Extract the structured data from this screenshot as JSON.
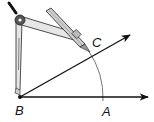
{
  "diagram": {
    "points": {
      "B": {
        "label": "B",
        "x": 20,
        "y": 97
      },
      "A": {
        "label": "A",
        "x": 103,
        "y": 97
      },
      "C": {
        "label": "C",
        "x": 93,
        "y": 57
      }
    },
    "rays": [
      {
        "from": "B",
        "to": [
          148,
          97
        ],
        "name": "ray-BA"
      },
      {
        "from": "B",
        "to": [
          130,
          35
        ],
        "name": "ray-BC"
      }
    ],
    "arc": {
      "center": "B",
      "radius": 83
    },
    "labels": {
      "B": "B",
      "A": "A",
      "C": "C"
    },
    "colors": {
      "line": "#111111",
      "arc": "#777777",
      "compass_fill": "#dddddd",
      "compass_stroke": "#222222"
    }
  }
}
